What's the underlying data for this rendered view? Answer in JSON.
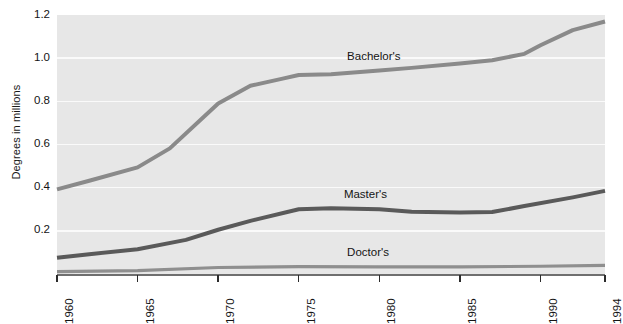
{
  "chart_data": {
    "type": "line",
    "title": "",
    "xlabel": "",
    "ylabel": "Degrees in millions",
    "xlim": [
      1960,
      1994
    ],
    "ylim": [
      0.0,
      1.2
    ],
    "grid": true,
    "legend_position": "inline-labels",
    "x_ticks": [
      1960,
      1965,
      1970,
      1975,
      1980,
      1985,
      1990,
      1994
    ],
    "x_tick_labels": [
      "1960",
      "1965",
      "1970",
      "1975",
      "1980",
      "1985",
      "1990",
      "1994"
    ],
    "y_ticks": [
      0.2,
      0.4,
      0.6,
      0.8,
      1.0,
      1.2
    ],
    "y_tick_labels": [
      "0.2",
      "0.4",
      "0.6",
      "0.8",
      "1.0",
      "1.2"
    ],
    "series": [
      {
        "name": "Bachelor's",
        "color": "#8a8a8a",
        "width": 4.0,
        "label_x": 1978.0,
        "label_y": 1.005,
        "x": [
          1960,
          1962,
          1965,
          1967,
          1970,
          1972,
          1974,
          1975,
          1977,
          1980,
          1982,
          1985,
          1987,
          1989,
          1990,
          1992,
          1994
        ],
        "values": [
          0.392,
          0.432,
          0.494,
          0.582,
          0.79,
          0.872,
          0.905,
          0.922,
          0.925,
          0.943,
          0.955,
          0.975,
          0.99,
          1.02,
          1.06,
          1.13,
          1.17
        ]
      },
      {
        "name": "Master's",
        "color": "#5a5a5a",
        "width": 4.0,
        "label_x": 1977.8,
        "label_y": 0.368,
        "x": [
          1960,
          1962,
          1965,
          1968,
          1970,
          1972,
          1975,
          1977,
          1980,
          1982,
          1985,
          1987,
          1989,
          1992,
          1994
        ],
        "values": [
          0.075,
          0.092,
          0.115,
          0.158,
          0.205,
          0.246,
          0.3,
          0.305,
          0.3,
          0.288,
          0.285,
          0.287,
          0.315,
          0.355,
          0.385
        ]
      },
      {
        "name": "Doctor's",
        "color": "#8f8f8f",
        "width": 3.2,
        "label_x": 1978.0,
        "label_y": 0.095,
        "x": [
          1960,
          1965,
          1970,
          1975,
          1980,
          1985,
          1990,
          1994
        ],
        "values": [
          0.011,
          0.016,
          0.03,
          0.034,
          0.033,
          0.033,
          0.036,
          0.04
        ]
      }
    ]
  }
}
